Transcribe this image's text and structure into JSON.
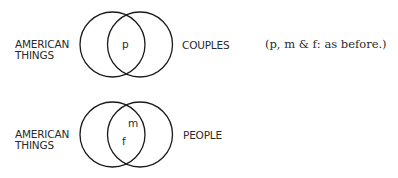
{
  "diagrams": [
    {
      "left_set": {
        "line1": "AMERICAN",
        "line2": "THINGS"
      },
      "right_set": "COUPLES",
      "intersection_labels": [
        "p"
      ],
      "note": "(p, m & f: as before.)"
    },
    {
      "left_set": {
        "line1": "AMERICAN",
        "line2": "THINGS"
      },
      "right_set": "PEOPLE",
      "intersection_labels": [
        "m",
        "f"
      ]
    }
  ],
  "colors": {
    "stroke": "#1a1a1a",
    "text": "#2a2a2a",
    "background": "#ffffff"
  }
}
